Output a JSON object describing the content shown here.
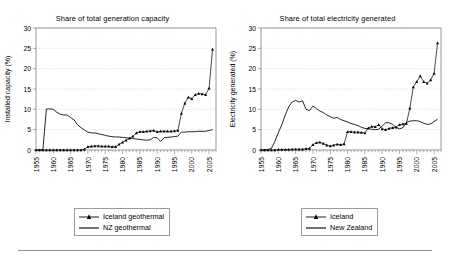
{
  "figure": {
    "width": 450,
    "height": 259,
    "background": "#ffffff",
    "rule_color": "#8d8d8d",
    "axis_color": "#808080",
    "grid_color": "#bdbdbd",
    "series_color": "#000000"
  },
  "chart_data": [
    {
      "type": "line",
      "panel": "left",
      "title": "Share of total generation capacity",
      "xlabel": "",
      "ylabel": "Installed capacity (%)",
      "xlim": [
        1955,
        2007
      ],
      "ylim": [
        0,
        30
      ],
      "yticks": [
        0,
        5,
        10,
        15,
        20,
        25,
        30
      ],
      "xticks": [
        1955,
        1960,
        1965,
        1970,
        1975,
        1980,
        1985,
        1990,
        1995,
        2000,
        2005
      ],
      "grid": "horizontal",
      "legend_position": "below",
      "series": [
        {
          "name": "Iceland geothermal",
          "marker": "triangle",
          "line": true,
          "x": [
            1955,
            1956,
            1957,
            1958,
            1959,
            1960,
            1961,
            1962,
            1963,
            1964,
            1965,
            1966,
            1967,
            1968,
            1969,
            1970,
            1971,
            1972,
            1973,
            1974,
            1975,
            1976,
            1977,
            1978,
            1979,
            1980,
            1981,
            1982,
            1983,
            1984,
            1985,
            1986,
            1987,
            1988,
            1989,
            1990,
            1991,
            1992,
            1993,
            1994,
            1995,
            1996,
            1997,
            1998,
            1999,
            2000,
            2001,
            2002,
            2003,
            2004,
            2005,
            2006
          ],
          "values": [
            0.0,
            0.0,
            0.0,
            0.0,
            0.0,
            0.0,
            0.0,
            0.0,
            0.0,
            0.0,
            0.0,
            0.0,
            0.0,
            0.0,
            0.2,
            0.8,
            0.9,
            1.0,
            1.0,
            0.9,
            0.9,
            0.9,
            0.8,
            0.8,
            1.4,
            1.9,
            2.4,
            2.9,
            3.4,
            4.2,
            4.5,
            4.5,
            4.6,
            4.7,
            4.8,
            4.5,
            4.6,
            4.6,
            4.6,
            4.6,
            4.7,
            4.8,
            9.0,
            11.5,
            13.0,
            12.6,
            13.6,
            13.9,
            13.8,
            13.6,
            15.2,
            24.8
          ]
        },
        {
          "name": "NZ geothermal",
          "marker": "none",
          "line": true,
          "x": [
            1955,
            1956,
            1957,
            1958,
            1959,
            1960,
            1961,
            1962,
            1963,
            1964,
            1965,
            1966,
            1967,
            1968,
            1969,
            1970,
            1971,
            1972,
            1973,
            1974,
            1975,
            1976,
            1977,
            1978,
            1979,
            1980,
            1981,
            1982,
            1983,
            1984,
            1985,
            1986,
            1987,
            1988,
            1989,
            1990,
            1991,
            1992,
            1993,
            1994,
            1995,
            1996,
            1997,
            1998,
            1999,
            2000,
            2001,
            2002,
            2003,
            2004,
            2005,
            2006
          ],
          "values": [
            0.0,
            0.0,
            0.1,
            10.1,
            10.1,
            10.0,
            9.3,
            8.8,
            8.6,
            8.6,
            8.0,
            7.4,
            6.2,
            5.5,
            4.9,
            4.4,
            4.2,
            4.2,
            4.0,
            3.8,
            3.6,
            3.4,
            3.3,
            3.2,
            3.2,
            3.1,
            3.0,
            2.9,
            2.8,
            2.7,
            2.6,
            2.5,
            2.4,
            2.5,
            3.1,
            3.0,
            2.1,
            3.0,
            3.1,
            3.2,
            3.3,
            3.4,
            4.4,
            4.4,
            4.5,
            4.5,
            4.5,
            4.6,
            4.6,
            4.6,
            4.8,
            5.0
          ]
        }
      ]
    },
    {
      "type": "line",
      "panel": "right",
      "title": "Share of total electricity generated",
      "xlabel": "",
      "ylabel": "Electricity generated (%)",
      "xlim": [
        1955,
        2007
      ],
      "ylim": [
        0,
        30
      ],
      "yticks": [
        0,
        5,
        10,
        15,
        20,
        25,
        30
      ],
      "xticks": [
        1955,
        1960,
        1965,
        1970,
        1975,
        1980,
        1985,
        1990,
        1995,
        2000,
        2005
      ],
      "grid": "horizontal",
      "legend_position": "below",
      "series": [
        {
          "name": "Iceland",
          "marker": "triangle",
          "line": true,
          "x": [
            1955,
            1956,
            1957,
            1958,
            1959,
            1960,
            1961,
            1962,
            1963,
            1964,
            1965,
            1966,
            1967,
            1968,
            1969,
            1970,
            1971,
            1972,
            1973,
            1974,
            1975,
            1976,
            1977,
            1978,
            1979,
            1980,
            1981,
            1982,
            1983,
            1984,
            1985,
            1986,
            1987,
            1988,
            1989,
            1990,
            1991,
            1992,
            1993,
            1994,
            1995,
            1996,
            1997,
            1998,
            1999,
            2000,
            2001,
            2002,
            2003,
            2004,
            2005,
            2006
          ],
          "values": [
            0.0,
            0.0,
            0.0,
            0.0,
            0.0,
            0.1,
            0.1,
            0.1,
            0.1,
            0.2,
            0.2,
            0.2,
            0.2,
            0.3,
            0.4,
            1.3,
            1.8,
            1.9,
            1.6,
            1.2,
            1.0,
            1.2,
            1.4,
            1.3,
            1.5,
            4.5,
            4.5,
            4.4,
            4.4,
            4.3,
            4.2,
            5.4,
            5.8,
            5.7,
            6.2,
            5.2,
            5.0,
            5.3,
            5.5,
            5.6,
            6.2,
            6.4,
            6.5,
            10.3,
            15.5,
            16.8,
            18.2,
            16.8,
            16.4,
            17.2,
            18.8,
            26.3
          ]
        },
        {
          "name": "New Zealand",
          "marker": "none",
          "line": true,
          "x": [
            1955,
            1956,
            1957,
            1958,
            1959,
            1960,
            1961,
            1962,
            1963,
            1964,
            1965,
            1966,
            1967,
            1968,
            1969,
            1970,
            1971,
            1972,
            1973,
            1974,
            1975,
            1976,
            1977,
            1978,
            1979,
            1980,
            1981,
            1982,
            1983,
            1984,
            1985,
            1986,
            1987,
            1988,
            1989,
            1990,
            1991,
            1992,
            1993,
            1994,
            1995,
            1996,
            1997,
            1998,
            1999,
            2000,
            2001,
            2002,
            2003,
            2004,
            2005,
            2006
          ],
          "values": [
            0.0,
            0.0,
            0.1,
            0.4,
            2.1,
            4.2,
            6.2,
            8.6,
            10.6,
            11.8,
            12.2,
            11.8,
            12.1,
            10.0,
            9.7,
            10.8,
            10.2,
            9.6,
            9.2,
            8.6,
            8.2,
            7.8,
            8.0,
            7.5,
            7.2,
            6.9,
            6.5,
            6.3,
            6.0,
            5.6,
            5.3,
            5.2,
            5.1,
            5.0,
            5.1,
            5.9,
            6.7,
            6.7,
            6.3,
            5.6,
            5.2,
            5.5,
            6.8,
            7.1,
            7.2,
            7.2,
            7.0,
            6.6,
            6.3,
            6.4,
            7.0,
            7.6
          ]
        }
      ]
    }
  ]
}
